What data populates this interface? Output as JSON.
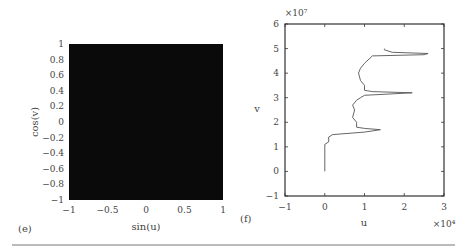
{
  "chart_data": [
    {
      "type": "heatmap",
      "panel_label": "(e)",
      "xlabel": "sin(u)",
      "ylabel": "cos(v)",
      "xlim": [
        -1,
        1
      ],
      "ylim": [
        -1,
        1
      ],
      "xticks": [
        -1,
        -0.5,
        0,
        0.5,
        1
      ],
      "xtick_labels": [
        "−1",
        "−0.5",
        "0",
        "0.5",
        "1"
      ],
      "yticks": [
        1,
        0.8,
        0.6,
        0.4,
        0.2,
        0,
        -0.2,
        -0.4,
        -0.6,
        -0.8,
        -1
      ],
      "ytick_labels": [
        "1",
        "0.8",
        "0.6",
        "0.4",
        "0.2",
        "0",
        "−0.2",
        "−0.4",
        "−0.6",
        "−0.8",
        "−1"
      ],
      "fill_color": "#0a0a0a",
      "description": "Region completely filled (dense trajectory points)"
    },
    {
      "type": "line",
      "panel_label": "(f)",
      "xlabel": "u",
      "ylabel": "v",
      "x_multiplier": "×10⁴",
      "y_multiplier": "×10⁷",
      "xlim": [
        -1,
        3
      ],
      "ylim": [
        -1,
        6
      ],
      "xticks": [
        -1,
        0,
        1,
        2,
        3
      ],
      "xtick_labels": [
        "−1",
        "0",
        "1",
        "2",
        "3"
      ],
      "yticks": [
        6,
        5,
        4,
        3,
        2,
        1,
        0,
        -1
      ],
      "ytick_labels": [
        "6",
        "5",
        "4",
        "3",
        "2",
        "1",
        "0",
        "−1"
      ],
      "series": [
        {
          "name": "trajectory",
          "color": "#555555",
          "x": [
            0,
            0,
            0.1,
            0.1,
            0.2,
            1.0,
            1.4,
            1.0,
            0.8,
            0.8,
            0.7,
            0.75,
            0.7,
            0.8,
            0.9,
            1.0,
            2.2,
            1.2,
            1.0,
            1.0,
            0.9,
            0.85,
            0.9,
            1.0,
            1.2,
            2.5,
            2.6,
            1.7,
            1.5,
            1.5
          ],
          "y": [
            0,
            1.1,
            1.2,
            1.4,
            1.5,
            1.6,
            1.7,
            1.75,
            1.8,
            2.0,
            2.2,
            2.5,
            2.7,
            2.9,
            3.0,
            3.1,
            3.2,
            3.25,
            3.3,
            3.5,
            3.7,
            4.0,
            4.2,
            4.4,
            4.7,
            4.75,
            4.8,
            4.85,
            4.95,
            5.0
          ]
        }
      ]
    }
  ]
}
